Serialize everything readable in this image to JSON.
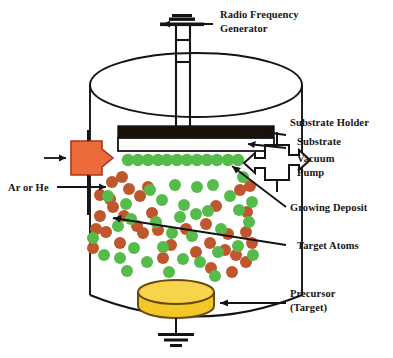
{
  "figure": {
    "type": "process-schematic",
    "background_color": "#ffffff"
  },
  "labels": {
    "rf_generator_line1": "Radio Frequency",
    "rf_generator_line2": "Generator",
    "substrate_holder": "Substrate Holder",
    "substrate": "Substrate",
    "vacuum_pump_line1": "Vacuum",
    "vacuum_pump_line2": "Pump",
    "growing_deposit": "Growing  Deposit",
    "target_atoms": "Target Atoms",
    "precursor_line1": "Precursor",
    "precursor_line2": "(Target)",
    "gas_inlet": "Ar or He"
  },
  "colors": {
    "outline": "#141414",
    "gas_inlet_block": "#ED6A3A",
    "gas_inlet_block_stroke": "#A8391A",
    "target_particle": "#C0562E",
    "deposit_particle": "#55BC4B",
    "target_top": "#F7D44C",
    "target_body": "#F2C829",
    "target_stroke": "#6B4A0E",
    "substrate_holder_fill": "#1A1208",
    "substrate_fill": "#ffffff"
  },
  "components": {
    "rf_generator": "rf-generator-electrode",
    "chamber": "vacuum-chamber-vessel",
    "substrate_holder": "substrate-holder-bar",
    "substrate": "substrate-bar",
    "growing_deposit": "deposit-particle-row",
    "vacuum_pump": "vacuum-pump-cross",
    "gas_inlet": "gas-inlet-arrow-block",
    "precursor_target": "precursor-target-cylinder",
    "ground": "ground-symbol",
    "plasma_cloud": "sputtered-particle-cloud"
  },
  "particles": {
    "deposit_row": [
      [
        128,
        160
      ],
      [
        138,
        160
      ],
      [
        148,
        160
      ],
      [
        158,
        160
      ],
      [
        167,
        160
      ],
      [
        177,
        160
      ],
      [
        187,
        160
      ],
      [
        197,
        160
      ],
      [
        207,
        160
      ],
      [
        217,
        160
      ],
      [
        228,
        160
      ],
      [
        238,
        160
      ]
    ],
    "cloud_target": [
      [
        112,
        182
      ],
      [
        122,
        177
      ],
      [
        100,
        195
      ],
      [
        110,
        199
      ],
      [
        129,
        189
      ],
      [
        140,
        196
      ],
      [
        100,
        216
      ],
      [
        113,
        207
      ],
      [
        124,
        216
      ],
      [
        96,
        229
      ],
      [
        106,
        232
      ],
      [
        137,
        226
      ],
      [
        152,
        213
      ],
      [
        158,
        230
      ],
      [
        186,
        229
      ],
      [
        206,
        224
      ],
      [
        216,
        206
      ],
      [
        228,
        234
      ],
      [
        240,
        190
      ],
      [
        247,
        212
      ],
      [
        210,
        243
      ],
      [
        225,
        250
      ],
      [
        236,
        255
      ],
      [
        196,
        252
      ],
      [
        246,
        262
      ],
      [
        120,
        243
      ],
      [
        143,
        233
      ],
      [
        171,
        245
      ],
      [
        232,
        272
      ],
      [
        211,
        268
      ],
      [
        246,
        232
      ],
      [
        163,
        258
      ],
      [
        252,
        243
      ],
      [
        148,
        187
      ],
      [
        93,
        248
      ],
      [
        250,
        186
      ]
    ],
    "cloud_deposit": [
      [
        108,
        196
      ],
      [
        126,
        204
      ],
      [
        150,
        190
      ],
      [
        162,
        200
      ],
      [
        175,
        185
      ],
      [
        184,
        205
      ],
      [
        197,
        187
      ],
      [
        213,
        185
      ],
      [
        230,
        196
      ],
      [
        243,
        177
      ],
      [
        208,
        211
      ],
      [
        196,
        214
      ],
      [
        239,
        210
      ],
      [
        252,
        202
      ],
      [
        118,
        226
      ],
      [
        131,
        219
      ],
      [
        156,
        222
      ],
      [
        180,
        217
      ],
      [
        172,
        233
      ],
      [
        192,
        236
      ],
      [
        221,
        229
      ],
      [
        249,
        222
      ],
      [
        104,
        255
      ],
      [
        120,
        258
      ],
      [
        134,
        248
      ],
      [
        147,
        262
      ],
      [
        163,
        247
      ],
      [
        183,
        259
      ],
      [
        200,
        262
      ],
      [
        218,
        252
      ],
      [
        238,
        246
      ],
      [
        93,
        238
      ],
      [
        253,
        255
      ],
      [
        169,
        272
      ],
      [
        127,
        271
      ],
      [
        215,
        276
      ]
    ]
  }
}
